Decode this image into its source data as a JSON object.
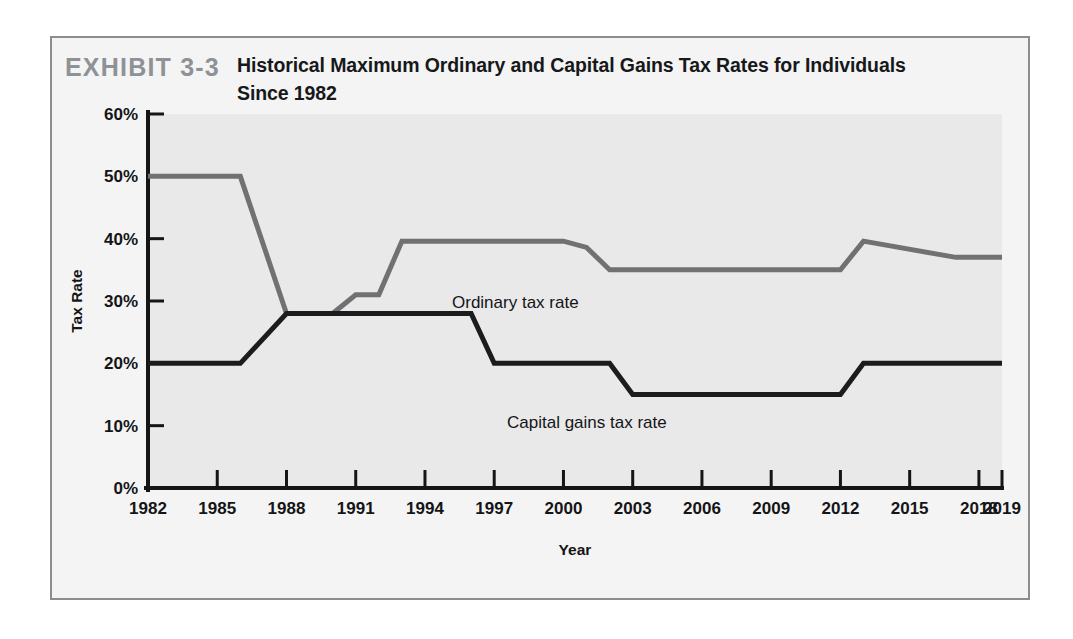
{
  "exhibit": {
    "number_label": "EXHIBIT 3-3",
    "title": "Historical Maximum Ordinary and Capital Gains Tax Rates for Individuals Since 1982"
  },
  "colors": {
    "ordinary_line": "#6f7173",
    "capital_gains_line": "#1c1c1e",
    "plot_background": "#e9e9e9",
    "axis": "#141517",
    "frame_border": "#8b8e91",
    "exhibit_number": "#8e9296",
    "page_background": "#ffffff"
  },
  "chart_data": {
    "type": "line",
    "title": "Historical Maximum Ordinary and Capital Gains Tax Rates for Individuals Since 1982",
    "xlabel": "Year",
    "ylabel": "Tax Rate",
    "xlim": [
      1982,
      2019
    ],
    "ylim": [
      0,
      60
    ],
    "y_tick_labels": [
      "0%",
      "10%",
      "20%",
      "30%",
      "40%",
      "50%",
      "60%"
    ],
    "y_tick_values": [
      0,
      10,
      20,
      30,
      40,
      50,
      60
    ],
    "x_tick_labels": [
      "1982",
      "1985",
      "1988",
      "1991",
      "1994",
      "1997",
      "2000",
      "2003",
      "2006",
      "2009",
      "2012",
      "2015",
      "2018",
      "2019"
    ],
    "x_tick_values": [
      1982,
      1985,
      1988,
      1991,
      1994,
      1997,
      2000,
      2003,
      2006,
      2009,
      2012,
      2015,
      2018,
      2019
    ],
    "grid": false,
    "legend_position": "inline-annotation",
    "series": [
      {
        "name": "Ordinary tax rate",
        "color": "#6f7173",
        "annotation": "Ordinary tax rate",
        "x": [
          1982,
          1986,
          1988,
          1990,
          1991,
          1992,
          1993,
          1996,
          2000,
          2001,
          2002,
          2012,
          2013,
          2017,
          2019
        ],
        "values": [
          50,
          50,
          28,
          28,
          31,
          31,
          39.6,
          39.6,
          39.6,
          38.6,
          35,
          35,
          39.6,
          37,
          37
        ]
      },
      {
        "name": "Capital gains tax rate",
        "color": "#1c1c1e",
        "annotation": "Capital gains tax rate",
        "x": [
          1982,
          1986,
          1988,
          1996,
          1997,
          2002,
          2003,
          2012,
          2013,
          2019
        ],
        "values": [
          20,
          20,
          28,
          28,
          20,
          20,
          15,
          15,
          20,
          20
        ]
      }
    ]
  }
}
